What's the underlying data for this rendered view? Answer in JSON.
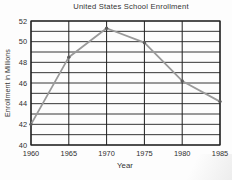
{
  "chart_data": {
    "type": "line",
    "title": "United States School Enrollment",
    "xlabel": "Year",
    "ylabel": "Enrollment in Millions",
    "x": [
      1960,
      1965,
      1970,
      1975,
      1980,
      1985
    ],
    "values": [
      42.0,
      48.5,
      51.3,
      49.9,
      46.2,
      44.2
    ],
    "xlim": [
      1960,
      1985
    ],
    "ylim": [
      40,
      52
    ],
    "x_tick_step": 5,
    "y_grid_step": 1,
    "y_tick_label_step": 2,
    "grid": true,
    "legend": "none",
    "line_color": "#9a9a9a",
    "marker_color": "#5a5a5a",
    "grid_color": "#1f1f1f",
    "tick_font_size": 7.4
  }
}
